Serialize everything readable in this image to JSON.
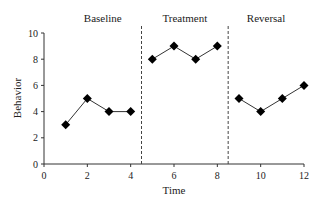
{
  "chart_data": {
    "type": "line",
    "title": "",
    "xlabel": "Time",
    "ylabel": "Behavior",
    "xlim": [
      0,
      12
    ],
    "ylim": [
      0,
      10
    ],
    "xticks": [
      0,
      2,
      4,
      6,
      8,
      10,
      12
    ],
    "yticks": [
      0,
      2,
      4,
      6,
      8,
      10
    ],
    "grid": false,
    "legend": null,
    "phases": [
      {
        "label": "Baseline",
        "x": [
          1,
          2,
          3,
          4
        ],
        "y": [
          3,
          5,
          4,
          4
        ]
      },
      {
        "label": "Treatment",
        "x": [
          5,
          6,
          7,
          8
        ],
        "y": [
          8,
          9,
          8,
          9
        ]
      },
      {
        "label": "Reversal",
        "x": [
          9,
          10,
          11,
          12
        ],
        "y": [
          5,
          4,
          5,
          6
        ]
      }
    ],
    "phase_dividers": [
      4.5,
      8.5
    ],
    "marker": "diamond",
    "color": "#000000"
  }
}
